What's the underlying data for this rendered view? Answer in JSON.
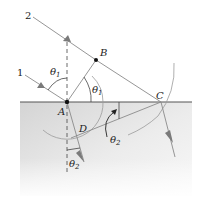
{
  "figure": {
    "type": "huygens-refraction-construction",
    "colors": {
      "ray": "#8a8a8a",
      "arrowhead": "#7a7a7a",
      "interface": "#555555",
      "normal": "#444444",
      "arc": "#9a9a9a",
      "medium_top": "#d6d6d6",
      "medium_bottom": "#f6f6f6",
      "dot": "#111111"
    },
    "rays": [
      {
        "label": "1"
      },
      {
        "label": "2"
      }
    ],
    "points": {
      "A": "A",
      "B": "B",
      "C": "C",
      "D": "D"
    },
    "angles": {
      "theta1_incident": "θ",
      "theta1_incident_sub": "1",
      "theta1_wavefront": "θ",
      "theta1_wavefront_sub": "1",
      "theta2_wavefront": "θ",
      "theta2_wavefront_sub": "2",
      "theta2_refracted": "θ",
      "theta2_refracted_sub": "2"
    }
  }
}
